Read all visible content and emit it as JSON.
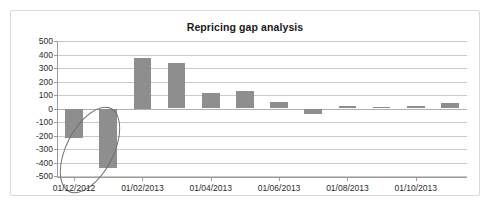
{
  "chart": {
    "title": "Repricing gap analysis",
    "bar_color": "#8e8e8e",
    "grid_color": "#c9c9c9",
    "axis_color": "#9a9a9a",
    "annotation_color": "#6f6f6f"
  },
  "chart_data": {
    "type": "bar",
    "title": "Repricing gap analysis",
    "xlabel": "",
    "ylabel": "",
    "ylim": [
      -500,
      500
    ],
    "ytick_labels": [
      "500",
      "400",
      "300",
      "200",
      "100",
      "0",
      "-100",
      "-200",
      "-300",
      "-400",
      "-500"
    ],
    "ytick_values": [
      500,
      400,
      300,
      200,
      100,
      0,
      -100,
      -200,
      -300,
      -400,
      -500
    ],
    "grid": true,
    "legend": "none",
    "categories": [
      "01/12/2012",
      "01/01/2013",
      "01/02/2013",
      "01/03/2013",
      "01/04/2013",
      "01/05/2013",
      "01/06/2013",
      "01/07/2013",
      "01/08/2013",
      "01/09/2013",
      "01/10/2013",
      "01/11/2013"
    ],
    "values": [
      -220,
      -440,
      375,
      335,
      115,
      130,
      45,
      -40,
      20,
      8,
      22,
      38
    ],
    "xtick_labels": [
      "01/12/2012",
      "01/02/2013",
      "01/04/2013",
      "01/06/2013",
      "01/08/2013",
      "01/10/2013"
    ],
    "xtick_category_index": [
      0,
      2,
      4,
      6,
      8,
      10
    ],
    "annotations": [
      {
        "name": "highlight-ellipse",
        "shape": "ellipse",
        "targets": [
          "01/12/2012",
          "01/01/2013"
        ],
        "note": "Tilted ellipse circling the two negative repricing gap bars"
      }
    ]
  }
}
